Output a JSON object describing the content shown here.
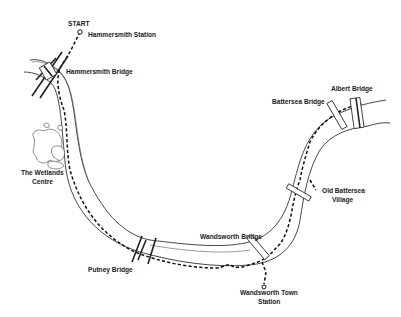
{
  "map": {
    "route_start": {
      "label": "START"
    },
    "places": [
      {
        "id": "hammersmith-station",
        "label_lines": [
          "Hammersmith Station"
        ]
      },
      {
        "id": "hammersmith-bridge",
        "label_lines": [
          "Hammersmith Bridge"
        ]
      },
      {
        "id": "wetlands-centre",
        "label_lines": [
          "The Wetlands",
          "Centre"
        ]
      },
      {
        "id": "putney-bridge",
        "label_lines": [
          "Putney Bridge"
        ]
      },
      {
        "id": "wandsworth-bridge",
        "label_lines": [
          "Wandsworth Bridge"
        ]
      },
      {
        "id": "wandsworth-town-station",
        "label_lines": [
          "Wandsworth Town",
          "Station"
        ]
      },
      {
        "id": "old-battersea-village",
        "label_lines": [
          "Old Battersea",
          "Village"
        ]
      },
      {
        "id": "battersea-bridge",
        "label_lines": [
          "Battersea Bridge"
        ]
      },
      {
        "id": "albert-bridge",
        "label_lines": [
          "Albert Bridge"
        ]
      }
    ],
    "colors": {
      "ink": "#222222",
      "background": "#ffffff"
    }
  }
}
